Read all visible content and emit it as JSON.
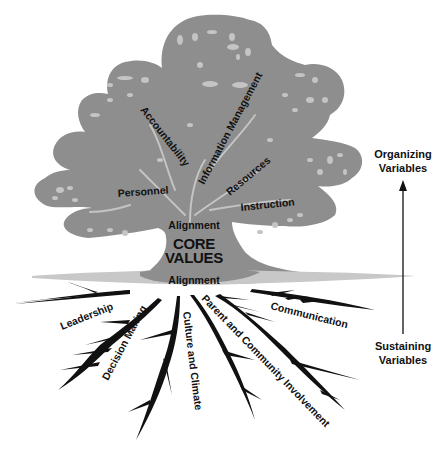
{
  "diagram": {
    "colors": {
      "canopy": "#8e8e8e",
      "canopy_highlight": "#c4c4c4",
      "roots": "#111111",
      "ground": "#c8c8c8",
      "text": "#111111"
    },
    "core": {
      "line1": "CORE",
      "line2": "VALUES",
      "alignment_top": "Alignment",
      "alignment_bottom": "Alignment"
    },
    "organizing_variables": [
      {
        "label": "Accountability"
      },
      {
        "label": "Information Management"
      },
      {
        "label": "Personnel"
      },
      {
        "label": "Resources"
      },
      {
        "label": "Instruction"
      }
    ],
    "sustaining_variables": [
      {
        "label": "Leadership"
      },
      {
        "label": "Decision Making"
      },
      {
        "label": "Culture and Climate"
      },
      {
        "label": "Parent and Community Involvement"
      },
      {
        "label": "Communication"
      }
    ],
    "axis": {
      "top_line1": "Organizing",
      "top_line2": "Variables",
      "bottom_line1": "Sustaining",
      "bottom_line2": "Variables",
      "direction": "up-arrow"
    }
  }
}
